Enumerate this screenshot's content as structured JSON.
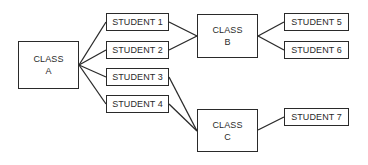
{
  "diagram": {
    "type": "hierarchy",
    "colors": {
      "stroke": "#2a2a2a",
      "background": "#ffffff",
      "text": "#2a2a2a"
    },
    "nodes": {
      "class_a": {
        "line1": "CLASS",
        "line2": "A",
        "x": 18,
        "y": 41,
        "w": 61,
        "h": 48
      },
      "student_1": {
        "label": "STUDENT 1",
        "x": 106,
        "y": 13,
        "w": 63,
        "h": 18
      },
      "student_2": {
        "label": "STUDENT 2",
        "x": 106,
        "y": 41,
        "w": 63,
        "h": 18
      },
      "student_3": {
        "label": "STUDENT 3",
        "x": 106,
        "y": 68,
        "w": 63,
        "h": 18
      },
      "student_4": {
        "label": "STUDENT 4",
        "x": 106,
        "y": 95,
        "w": 63,
        "h": 18
      },
      "class_b": {
        "line1": "CLASS",
        "line2": "B",
        "x": 197,
        "y": 14,
        "w": 61,
        "h": 44
      },
      "student_5": {
        "label": "STUDENT 5",
        "x": 284,
        "y": 13,
        "w": 65,
        "h": 18
      },
      "student_6": {
        "label": "STUDENT 6",
        "x": 284,
        "y": 41,
        "w": 65,
        "h": 18
      },
      "class_c": {
        "line1": "CLASS",
        "line2": "C",
        "x": 197,
        "y": 109,
        "w": 61,
        "h": 43
      },
      "student_7": {
        "label": "STUDENT 7",
        "x": 284,
        "y": 108,
        "w": 65,
        "h": 18
      }
    },
    "edges": [
      {
        "from": "class_a",
        "to": "student_1"
      },
      {
        "from": "class_a",
        "to": "student_2"
      },
      {
        "from": "class_a",
        "to": "student_3"
      },
      {
        "from": "class_a",
        "to": "student_4"
      },
      {
        "from": "student_1",
        "to": "class_b"
      },
      {
        "from": "student_2",
        "to": "class_b"
      },
      {
        "from": "student_3",
        "to": "class_c"
      },
      {
        "from": "student_4",
        "to": "class_c"
      },
      {
        "from": "class_b",
        "to": "student_5"
      },
      {
        "from": "class_b",
        "to": "student_6"
      },
      {
        "from": "class_c",
        "to": "student_7"
      }
    ]
  }
}
